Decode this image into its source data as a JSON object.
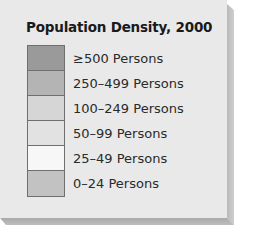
{
  "legend": {
    "title": "Population Density, 2000",
    "items": [
      {
        "label": "≥500 Persons",
        "color": "#9a9a9a"
      },
      {
        "label": "250–499 Persons",
        "color": "#b4b4b4"
      },
      {
        "label": "100–249 Persons",
        "color": "#d6d6d6"
      },
      {
        "label": "50–99 Persons",
        "color": "#e2e2e2"
      },
      {
        "label": "25–49 Persons",
        "color": "#f7f7f7"
      },
      {
        "label": "0–24 Persons",
        "color": "#c2c2c2"
      }
    ]
  },
  "colors": {
    "panel_background": "#e9e9e9",
    "swatch_border": "#6f6f6f",
    "bevel": "#b5b5b5"
  }
}
